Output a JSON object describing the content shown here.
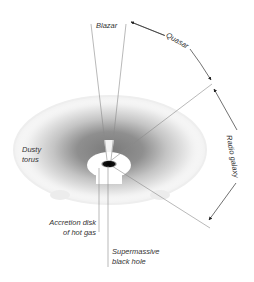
{
  "diagram": {
    "labels": {
      "blazar": "Blazar",
      "quasar": "Quasar",
      "radio_galaxy": "Radio galaxy",
      "dusty_torus_line1": "Dusty",
      "dusty_torus_line2": "torus",
      "accretion_line1": "Accretion disk",
      "accretion_line2": "of hot gas",
      "smbh_line1": "Supermassive",
      "smbh_line2": "black hole"
    },
    "colors": {
      "line": "#8a8a8a",
      "arrow": "#333333",
      "torus_dark": "#8c8c8c",
      "torus_light": "#e6e6e6",
      "black_hole": "#000000",
      "text": "#333333"
    }
  }
}
